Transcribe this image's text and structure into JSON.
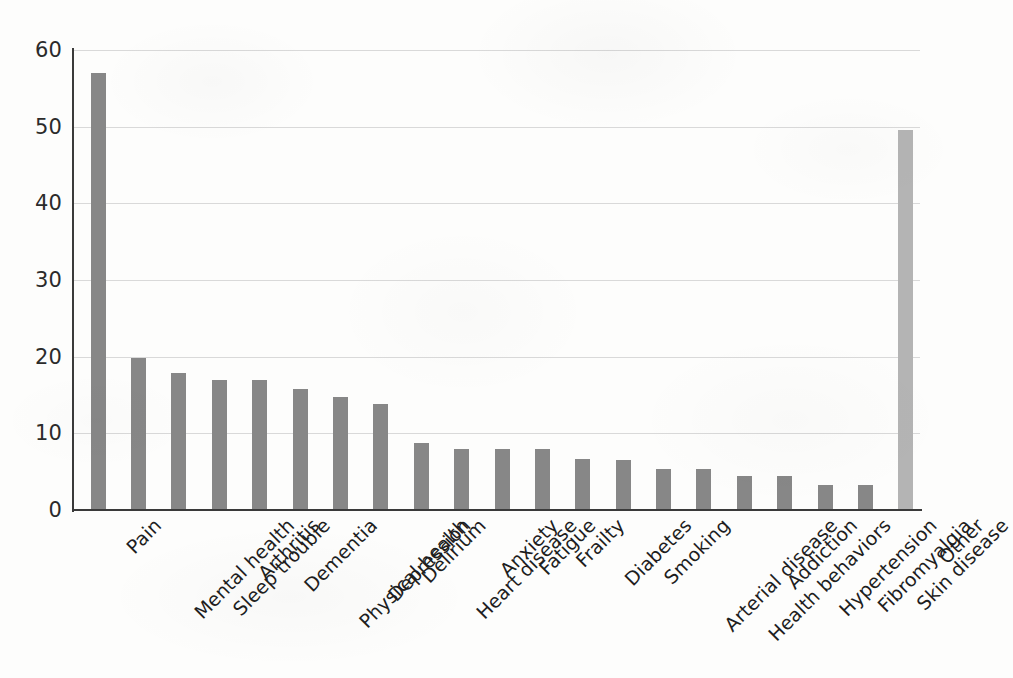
{
  "chart_data": {
    "type": "bar",
    "title": "",
    "subtitle": "",
    "xlabel": "",
    "ylabel": "",
    "ylim": [
      0,
      60
    ],
    "ytick_values": [
      0,
      10,
      20,
      30,
      40,
      50,
      60
    ],
    "ytick_labels": [
      "0",
      "10",
      "20",
      "30",
      "40",
      "50",
      "60"
    ],
    "grid": "horizontal",
    "legend": "none",
    "bar_color": "#878787",
    "highlight_color": "#b4b4b4",
    "axis_color": "#3a3a3a",
    "gridline_color": "#d9d9d9",
    "categories": [
      "Pain",
      "Mental health",
      "Sleep trouble",
      "Arthritis",
      "Dementia",
      "Physical health",
      "Depression",
      "Delirium",
      "Heart disease",
      "Anxiety",
      "Fatigue",
      "Frailty",
      "Diabetes",
      "Smoking",
      "Arterial disease",
      "Health behaviors",
      "Addiction",
      "Hypertension",
      "Fibromyalgia",
      "Skin disease",
      "Other"
    ],
    "values": [
      57.0,
      19.8,
      17.9,
      16.9,
      16.9,
      15.8,
      14.8,
      13.8,
      8.7,
      7.9,
      7.9,
      7.9,
      6.6,
      6.5,
      5.4,
      5.4,
      4.5,
      4.5,
      3.3,
      3.3,
      49.6
    ],
    "highlight_categories": [
      "Other"
    ],
    "annotations": []
  }
}
